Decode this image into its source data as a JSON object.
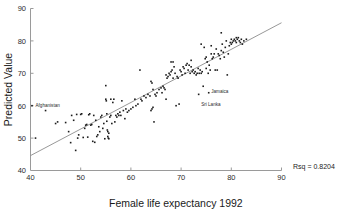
{
  "chart_data": {
    "type": "scatter",
    "title": "",
    "xlabel": "Female life expectancy 1992",
    "ylabel": "Predicted Value",
    "xlim": [
      40,
      90
    ],
    "ylim": [
      40,
      90
    ],
    "xticks": [
      40,
      50,
      60,
      70,
      80,
      90
    ],
    "yticks": [
      40,
      50,
      60,
      70,
      80,
      90
    ],
    "grid": false,
    "legend": null,
    "annotations": [
      {
        "name": "rsq",
        "text": "Rsq = 0.8204",
        "x": 92,
        "y": 41
      }
    ],
    "point_labels": [
      {
        "text": "Afghanistan",
        "x": 40.5,
        "y": 60.0
      },
      {
        "text": "Jamaica",
        "x": 75.5,
        "y": 64.5
      },
      {
        "text": "Sri Lanka",
        "x": 73.5,
        "y": 60.5
      }
    ],
    "fit_line": {
      "x": [
        40,
        90
      ],
      "y": [
        44.6,
        85.6
      ],
      "color": "#8c8c8c"
    },
    "marker": {
      "shape": "square",
      "size": 1.6,
      "color": "#1c1c1c"
    },
    "x": [
      40.3,
      41.0,
      43.0,
      45.0,
      45.4,
      47.0,
      47.6,
      48.0,
      48.2,
      48.6,
      49.0,
      49.2,
      49.4,
      49.6,
      50.0,
      50.2,
      50.5,
      50.8,
      51.0,
      51.2,
      51.4,
      51.6,
      51.8,
      52.0,
      52.2,
      52.4,
      52.6,
      52.8,
      53.0,
      53.2,
      53.4,
      53.6,
      53.8,
      54.0,
      54.2,
      54.4,
      54.6,
      54.8,
      55.0,
      55.0,
      55.1,
      55.2,
      55.2,
      55.3,
      55.4,
      55.4,
      55.5,
      55.6,
      55.6,
      55.8,
      56.0,
      56.0,
      56.2,
      56.4,
      56.6,
      56.8,
      57.0,
      57.2,
      57.4,
      57.6,
      57.8,
      58.0,
      58.2,
      58.5,
      58.8,
      59.0,
      59.3,
      59.6,
      60.0,
      60.4,
      60.8,
      61.0,
      61.4,
      61.8,
      62.0,
      62.2,
      62.6,
      63.0,
      63.4,
      63.8,
      64.0,
      64.0,
      64.2,
      64.2,
      64.4,
      64.4,
      64.6,
      64.8,
      65.0,
      65.2,
      65.6,
      66.0,
      66.2,
      66.4,
      66.6,
      66.8,
      67.0,
      67.0,
      67.2,
      67.4,
      67.6,
      67.8,
      68.0,
      68.0,
      68.2,
      68.4,
      68.4,
      68.6,
      68.8,
      69.0,
      69.2,
      69.4,
      69.6,
      69.8,
      70.0,
      70.2,
      70.4,
      70.6,
      70.8,
      71.0,
      71.2,
      71.4,
      71.6,
      71.8,
      72.0,
      72.0,
      72.2,
      72.4,
      72.6,
      72.8,
      73.0,
      73.2,
      73.4,
      73.5,
      73.6,
      73.8,
      74.0,
      74.0,
      74.2,
      74.4,
      74.6,
      74.8,
      75.0,
      75.0,
      75.2,
      75.4,
      75.5,
      75.6,
      75.8,
      76.0,
      76.0,
      76.2,
      76.4,
      76.6,
      76.8,
      77.0,
      77.2,
      77.4,
      77.6,
      77.8,
      78.0,
      78.0,
      78.2,
      78.4,
      78.6,
      78.8,
      79.0,
      79.2,
      79.4,
      79.6,
      79.8,
      80.0,
      80.0,
      80.2,
      80.4,
      80.6,
      80.8,
      81.0,
      81.0,
      81.2,
      81.4,
      81.6,
      81.8,
      82.0,
      82.2,
      82.5,
      83.0
    ],
    "y": [
      60.0,
      50.0,
      58.5,
      54.5,
      55.0,
      54.8,
      52.0,
      48.6,
      57.0,
      55.5,
      46.2,
      57.3,
      50.0,
      51.0,
      57.3,
      57.5,
      50.2,
      53.0,
      54.0,
      54.2,
      50.3,
      57.2,
      57.5,
      54.0,
      54.2,
      49.0,
      57.0,
      48.7,
      55.5,
      50.5,
      51.0,
      53.5,
      52.0,
      56.5,
      57.0,
      53.0,
      54.5,
      49.8,
      66.2,
      62.0,
      61.5,
      57.5,
      55.2,
      52.5,
      52.0,
      50.5,
      50.0,
      49.8,
      51.5,
      56.5,
      62.0,
      57.0,
      54.5,
      61.0,
      62.0,
      55.0,
      57.0,
      56.5,
      57.5,
      57.0,
      58.0,
      57.0,
      61.5,
      58.5,
      56.0,
      59.0,
      58.0,
      58.5,
      59.0,
      59.5,
      62.0,
      60.0,
      60.5,
      71.0,
      62.0,
      61.5,
      63.0,
      62.5,
      63.5,
      63.0,
      67.5,
      58.5,
      67.0,
      59.0,
      65.0,
      59.5,
      55.0,
      63.5,
      63.0,
      64.0,
      65.0,
      65.5,
      64.0,
      66.0,
      65.5,
      65.0,
      69.5,
      62.0,
      68.5,
      69.0,
      70.0,
      69.5,
      73.5,
      70.5,
      71.0,
      73.5,
      68.5,
      72.0,
      70.0,
      60.0,
      69.0,
      68.5,
      60.5,
      71.0,
      70.5,
      69.5,
      72.0,
      71.5,
      70.0,
      72.5,
      73.0,
      71.0,
      72.5,
      70.0,
      74.0,
      72.0,
      70.5,
      71.0,
      70.0,
      70.5,
      69.5,
      70.0,
      71.5,
      63.5,
      70.0,
      71.0,
      79.0,
      70.0,
      70.5,
      66.0,
      78.0,
      74.5,
      75.0,
      71.5,
      73.5,
      70.0,
      64.0,
      72.5,
      71.0,
      78.5,
      76.0,
      74.5,
      75.0,
      76.0,
      71.0,
      77.5,
      71.0,
      76.0,
      75.5,
      74.5,
      82.5,
      77.0,
      79.0,
      76.5,
      75.0,
      78.0,
      80.0,
      69.5,
      76.0,
      78.5,
      79.5,
      80.5,
      79.0,
      79.5,
      80.0,
      80.5,
      80.0,
      81.0,
      79.5,
      80.5,
      81.0,
      80.0,
      79.5,
      80.5,
      79.0,
      80.0,
      80.5
    ]
  }
}
